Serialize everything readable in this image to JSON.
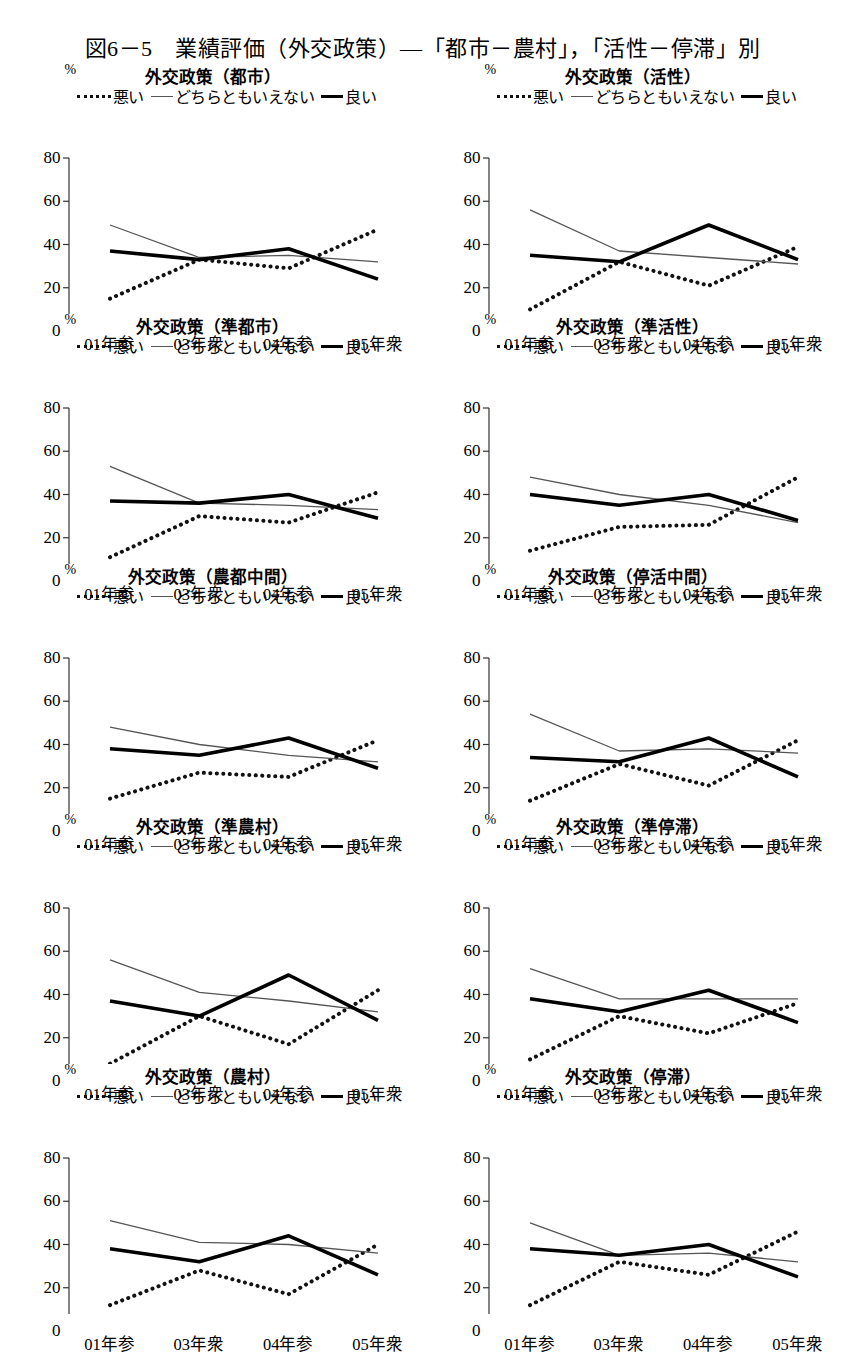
{
  "figure": {
    "title": "図6－5　業績評価（外交政策）—「都市－農村」，「活性－停滞」別"
  },
  "legend": {
    "bad_label": "悪い",
    "neutral_label": "どちらともいえない",
    "good_label": "良い",
    "bad_style": "dotted",
    "neutral_style": "thin-solid",
    "good_style": "thick-solid",
    "bad_color": "#111111",
    "neutral_color": "#555555",
    "good_color": "#000000"
  },
  "axes": {
    "unit": "%",
    "y_ticks": [
      0,
      20,
      40,
      60,
      80
    ],
    "y_min": 0,
    "y_max": 80,
    "x_labels": [
      "01年参",
      "03年衆",
      "04年参",
      "05年衆"
    ],
    "grid": false
  },
  "chart_data": [
    {
      "type": "line",
      "title": "外交政策（都市）",
      "categories": [
        "01年参",
        "03年衆",
        "04年参",
        "05年衆"
      ],
      "series": [
        {
          "name": "悪い",
          "values": [
            15,
            33,
            29,
            47
          ]
        },
        {
          "name": "どちらともいえない",
          "values": [
            49,
            34,
            35,
            32
          ]
        },
        {
          "name": "良い",
          "values": [
            37,
            33,
            38,
            24
          ]
        }
      ],
      "xlabel": "",
      "ylabel": "%",
      "ylim": [
        0,
        80
      ]
    },
    {
      "type": "line",
      "title": "外交政策（活性）",
      "categories": [
        "01年参",
        "03年衆",
        "04年参",
        "05年衆"
      ],
      "series": [
        {
          "name": "悪い",
          "values": [
            10,
            32,
            21,
            39
          ]
        },
        {
          "name": "どちらともいえない",
          "values": [
            56,
            37,
            34,
            31
          ]
        },
        {
          "name": "良い",
          "values": [
            35,
            32,
            49,
            33
          ]
        }
      ],
      "xlabel": "",
      "ylabel": "%",
      "ylim": [
        0,
        80
      ]
    },
    {
      "type": "line",
      "title": "外交政策（準都市）",
      "categories": [
        "01年参",
        "03年衆",
        "04年参",
        "05年衆"
      ],
      "series": [
        {
          "name": "悪い",
          "values": [
            11,
            30,
            27,
            41
          ]
        },
        {
          "name": "どちらともいえない",
          "values": [
            53,
            36,
            35,
            33
          ]
        },
        {
          "name": "良い",
          "values": [
            37,
            36,
            40,
            29
          ]
        }
      ],
      "xlabel": "",
      "ylabel": "%",
      "ylim": [
        0,
        80
      ]
    },
    {
      "type": "line",
      "title": "外交政策（準活性）",
      "categories": [
        "01年参",
        "03年衆",
        "04年参",
        "05年衆"
      ],
      "series": [
        {
          "name": "悪い",
          "values": [
            14,
            25,
            26,
            48
          ]
        },
        {
          "name": "どちらともいえない",
          "values": [
            48,
            40,
            35,
            27
          ]
        },
        {
          "name": "良い",
          "values": [
            40,
            35,
            40,
            28
          ]
        }
      ],
      "xlabel": "",
      "ylabel": "%",
      "ylim": [
        0,
        80
      ]
    },
    {
      "type": "line",
      "title": "外交政策（農都中間）",
      "categories": [
        "01年参",
        "03年衆",
        "04年参",
        "05年衆"
      ],
      "series": [
        {
          "name": "悪い",
          "values": [
            15,
            27,
            25,
            42
          ]
        },
        {
          "name": "どちらともいえない",
          "values": [
            48,
            40,
            35,
            32
          ]
        },
        {
          "name": "良い",
          "values": [
            38,
            35,
            43,
            29
          ]
        }
      ],
      "xlabel": "",
      "ylabel": "%",
      "ylim": [
        0,
        80
      ]
    },
    {
      "type": "line",
      "title": "外交政策（停活中間）",
      "categories": [
        "01年参",
        "03年衆",
        "04年参",
        "05年衆"
      ],
      "series": [
        {
          "name": "悪い",
          "values": [
            14,
            31,
            21,
            42
          ]
        },
        {
          "name": "どちらともいえない",
          "values": [
            54,
            37,
            38,
            36
          ]
        },
        {
          "name": "良い",
          "values": [
            34,
            32,
            43,
            25
          ]
        }
      ],
      "xlabel": "",
      "ylabel": "%",
      "ylim": [
        0,
        80
      ]
    },
    {
      "type": "line",
      "title": "外交政策（準農村）",
      "categories": [
        "01年参",
        "03年衆",
        "04年参",
        "05年衆"
      ],
      "series": [
        {
          "name": "悪い",
          "values": [
            8,
            30,
            17,
            42
          ]
        },
        {
          "name": "どちらともいえない",
          "values": [
            56,
            41,
            37,
            32
          ]
        },
        {
          "name": "良い",
          "values": [
            37,
            30,
            49,
            28
          ]
        }
      ],
      "xlabel": "",
      "ylabel": "%",
      "ylim": [
        0,
        80
      ]
    },
    {
      "type": "line",
      "title": "外交政策（準停滞）",
      "categories": [
        "01年参",
        "03年衆",
        "04年参",
        "05年衆"
      ],
      "series": [
        {
          "name": "悪い",
          "values": [
            10,
            30,
            22,
            36
          ]
        },
        {
          "name": "どちらともいえない",
          "values": [
            52,
            38,
            38,
            38
          ]
        },
        {
          "name": "良い",
          "values": [
            38,
            32,
            42,
            27
          ]
        }
      ],
      "xlabel": "",
      "ylabel": "%",
      "ylim": [
        0,
        80
      ]
    },
    {
      "type": "line",
      "title": "外交政策（農村）",
      "categories": [
        "01年参",
        "03年衆",
        "04年参",
        "05年衆"
      ],
      "series": [
        {
          "name": "悪い",
          "values": [
            12,
            28,
            17,
            40
          ]
        },
        {
          "name": "どちらともいえない",
          "values": [
            51,
            41,
            40,
            36
          ]
        },
        {
          "name": "良い",
          "values": [
            38,
            32,
            44,
            26
          ]
        }
      ],
      "xlabel": "",
      "ylabel": "%",
      "ylim": [
        0,
        80
      ]
    },
    {
      "type": "line",
      "title": "外交政策（停滞）",
      "categories": [
        "01年参",
        "03年衆",
        "04年参",
        "05年衆"
      ],
      "series": [
        {
          "name": "悪い",
          "values": [
            12,
            32,
            26,
            46
          ]
        },
        {
          "name": "どちらともいえない",
          "values": [
            50,
            35,
            36,
            32
          ]
        },
        {
          "name": "良い",
          "values": [
            38,
            35,
            40,
            25
          ]
        }
      ],
      "xlabel": "",
      "ylabel": "%",
      "ylim": [
        0,
        80
      ]
    }
  ]
}
